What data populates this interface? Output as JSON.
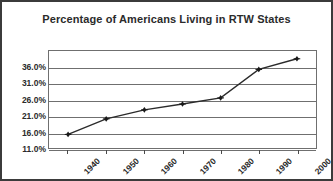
{
  "chart_data": {
    "type": "line",
    "title": "Percentage of Americans Living in RTW States",
    "xlabel": "",
    "ylabel": "",
    "categories": [
      "1940",
      "1950",
      "1960",
      "1970",
      "1980",
      "1990",
      "2000"
    ],
    "values": [
      15.2,
      20.0,
      22.8,
      24.6,
      26.5,
      35.3,
      38.6
    ],
    "series": [
      {
        "name": "Percentage of Americans Living in RTW States",
        "values": [
          15.2,
          20.0,
          22.8,
          24.6,
          26.5,
          35.3,
          38.6
        ]
      }
    ],
    "ylim": [
      11.0,
      41.0
    ],
    "ytick_labels": [
      "11.0%",
      "16.0%",
      "21.0%",
      "26.0%",
      "31.0%",
      "36.0%"
    ],
    "ytick_values": [
      11.0,
      16.0,
      21.0,
      26.0,
      31.0,
      36.0
    ],
    "xtick_labels": [
      "1940",
      "1950",
      "1960",
      "1970",
      "1980",
      "1990",
      "2000"
    ],
    "grid": "horizontal",
    "legend": "none",
    "line_color": "#2b2b2b",
    "marker": "diamond",
    "marker_color": "#1a1a1a",
    "background_color": "#ffffff",
    "border_color": "#3b3b3b"
  }
}
